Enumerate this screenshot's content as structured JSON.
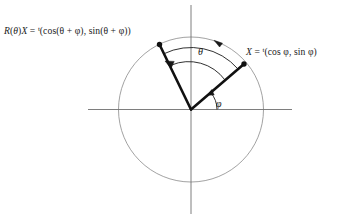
{
  "figure": {
    "type": "geometric-diagram",
    "background_color": "#ffffff",
    "width": 343,
    "height": 219
  },
  "labels": {
    "rotated_vector": {
      "lhs_r": "R",
      "lhs_paren_open": "(",
      "lhs_theta": "θ",
      "lhs_paren_close": ")",
      "lhs_x": "X",
      "equals": " = ",
      "transpose": "t",
      "rhs": "(cos(θ + φ), sin(θ + φ))"
    },
    "original_vector": {
      "lhs_x": "X",
      "equals": " = ",
      "transpose": "t",
      "rhs": "(cos φ, sin φ)"
    },
    "angle_theta": "θ",
    "angle_phi": "φ"
  },
  "geometry": {
    "origin": {
      "x": 191,
      "y": 109.5
    },
    "circle": {
      "cx": 191,
      "cy": 109.5,
      "r": 72.5,
      "stroke": "#8a8a8a",
      "stroke_width": 0.8,
      "fill": "none"
    },
    "axes": {
      "stroke": "#6f6f6f",
      "stroke_width": 0.9,
      "horizontal": {
        "x1": 88,
        "y1": 109.5,
        "x2": 292,
        "y2": 109.5
      },
      "vertical": {
        "x1": 191,
        "y1": 5,
        "x2": 191,
        "y2": 214
      }
    },
    "vectors": {
      "stroke": "#111111",
      "stroke_width": 2.6,
      "dot_radius": 2.6,
      "dot_fill": "#111111",
      "original": {
        "name": "X",
        "from": {
          "x": 191,
          "y": 109.5
        },
        "to": {
          "x": 244,
          "y": 64
        },
        "angle_deg": 41
      },
      "rotated": {
        "name": "R(theta)X",
        "from": {
          "x": 191,
          "y": 109.5
        },
        "to": {
          "x": 159.5,
          "y": 44.5
        },
        "angle_deg": 116
      }
    },
    "arcs": {
      "stroke": "#1a1a1a",
      "stroke_width": 0.9,
      "theta_outer": {
        "radius": 62,
        "start_deg": 41,
        "end_deg": 116,
        "arrow_at": "start",
        "arrow_point": {
          "x": 219,
          "y": 40.5
        }
      },
      "theta_inner": {
        "radius": 45,
        "start_deg": 41,
        "end_deg": 116,
        "arrow_at": "end",
        "arrow_point": {
          "x": 166,
          "y": 60
        }
      },
      "phi": {
        "radius": 26,
        "start_deg": 0,
        "end_deg": 41,
        "arrow_at": "end",
        "arrow_point": {
          "x": 211,
          "y": 94
        }
      }
    }
  },
  "colors": {
    "ink": "#1a1a1a",
    "vector": "#111111",
    "circle": "#8a8a8a",
    "axis": "#6f6f6f",
    "background": "#ffffff"
  }
}
